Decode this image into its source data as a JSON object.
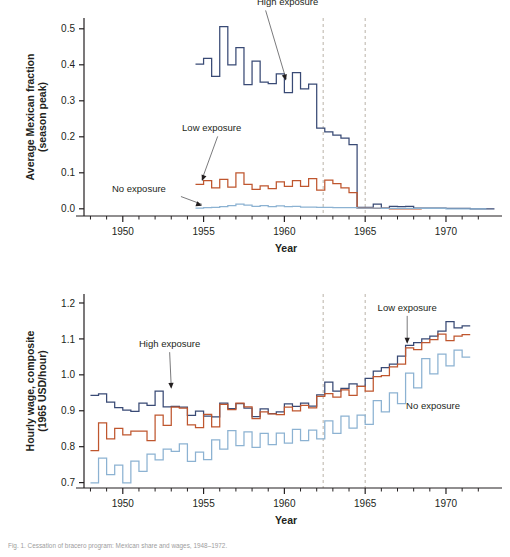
{
  "figure": {
    "caption": "Fig. 1. Cessation of bracero program: Mexican share and wages, 1948–1972."
  },
  "chart_data": [
    {
      "id": "top",
      "type": "line",
      "title": "",
      "xlabel": "Year",
      "ylabel": "Average Mexican fraction\n(season peak)",
      "ylabel_line1": "Average Mexican fraction",
      "ylabel_line2": "(season peak)",
      "xlim": [
        1947.6,
        1972.6
      ],
      "ylim": [
        -0.02,
        0.53
      ],
      "xticks": [
        1950,
        1955,
        1960,
        1965,
        1970
      ],
      "xticklabels": [
        "1950",
        "1955",
        "1960",
        "1965",
        "1970"
      ],
      "xminorticks": [
        1948,
        1949,
        1951,
        1952,
        1953,
        1954,
        1956,
        1957,
        1958,
        1959,
        1961,
        1962,
        1963,
        1964,
        1966,
        1967,
        1968,
        1969,
        1971,
        1972
      ],
      "yticks": [
        0.0,
        0.1,
        0.2,
        0.3,
        0.4,
        0.5
      ],
      "yticklabels": [
        "0.0",
        "0.1",
        "0.2",
        "0.3",
        "0.4",
        "0.5"
      ],
      "grid": false,
      "legend": "annotations",
      "vlines": [
        1962.4,
        1965.0
      ],
      "vline_style": "dashed",
      "vline_color": "#b9b2a8",
      "annotations": [
        {
          "label": "High exposure",
          "text_x": 1960.2,
          "text_y": 0.565,
          "point_x": 1960.1,
          "point_y": 0.352
        },
        {
          "label": "Low exposure",
          "text_x": 1955.5,
          "text_y": 0.215,
          "point_x": 1954.9,
          "point_y": 0.073
        },
        {
          "label": "No exposure",
          "text_x": 1951.0,
          "text_y": 0.048,
          "point_x": 1954.9,
          "point_y": 0.004
        }
      ],
      "series": [
        {
          "name": "High exposure",
          "color": "#394a75",
          "x": [
            1954.5,
            1955,
            1955.5,
            1956,
            1956.5,
            1957,
            1957.5,
            1958,
            1958.5,
            1959,
            1959.5,
            1960,
            1960.5,
            1961,
            1961.5,
            1962,
            1962.5,
            1963,
            1963.5,
            1964,
            1964.5,
            1965,
            1965.5,
            1966,
            1966.5,
            1967,
            1967.5,
            1968,
            1968.5,
            1969,
            1969.5,
            1970,
            1970.5,
            1971,
            1971.5,
            1972,
            1972.5
          ],
          "values": [
            0.402,
            0.418,
            0.368,
            0.506,
            0.4,
            0.448,
            0.345,
            0.41,
            0.352,
            0.348,
            0.375,
            0.323,
            0.378,
            0.333,
            0.346,
            0.224,
            0.214,
            0.205,
            0.196,
            0.178,
            0.004,
            0.004,
            0.013,
            0.002,
            0.007,
            0.006,
            0.007,
            0.002,
            0.002,
            0.002,
            0.002,
            0.001,
            0.001,
            0.001,
            0.0,
            0.0,
            0.0
          ]
        },
        {
          "name": "Low exposure",
          "color": "#bf562e",
          "x": [
            1954.5,
            1955,
            1955.5,
            1956,
            1956.5,
            1957,
            1957.5,
            1958,
            1958.5,
            1959,
            1959.5,
            1960,
            1960.5,
            1961,
            1961.5,
            1962,
            1962.5,
            1963,
            1963.5,
            1964,
            1964.5,
            1965,
            1965.5,
            1966,
            1966.5,
            1967,
            1967.5,
            1968
          ],
          "values": [
            0.068,
            0.078,
            0.058,
            0.082,
            0.06,
            0.1,
            0.068,
            0.054,
            0.064,
            0.056,
            0.075,
            0.062,
            0.078,
            0.062,
            0.084,
            0.052,
            0.08,
            0.07,
            0.058,
            0.045,
            0.002,
            0.002,
            0.001,
            0.001,
            0.0,
            0.0,
            0.0,
            0.0
          ]
        },
        {
          "name": "No exposure",
          "color": "#8cb2d2",
          "x": [
            1954.5,
            1955,
            1955.5,
            1956,
            1956.5,
            1957,
            1957.5,
            1958,
            1958.5,
            1959,
            1959.5,
            1960,
            1960.5,
            1961,
            1961.5,
            1962,
            1962.5,
            1963,
            1963.5,
            1964,
            1964.5,
            1965,
            1966,
            1967,
            1968,
            1969,
            1970,
            1971,
            1972
          ],
          "values": [
            0.002,
            0.003,
            0.004,
            0.006,
            0.009,
            0.013,
            0.01,
            0.007,
            0.009,
            0.006,
            0.008,
            0.006,
            0.007,
            0.005,
            0.005,
            0.004,
            0.004,
            0.003,
            0.003,
            0.003,
            0.002,
            0.002,
            0.001,
            0.001,
            0.001,
            0.001,
            0.0,
            0.0,
            0.0
          ]
        }
      ]
    },
    {
      "id": "bottom",
      "type": "line",
      "title": "",
      "xlabel": "Year",
      "ylabel": "Hourly wage, composite\n(1965 USD/hour)",
      "ylabel_line1": "Hourly wage, composite",
      "ylabel_line2": "(1965 USD/hour)",
      "xlim": [
        1947.6,
        1972.6
      ],
      "ylim": [
        0.685,
        1.225
      ],
      "xticks": [
        1950,
        1955,
        1960,
        1965,
        1970
      ],
      "xticklabels": [
        "1950",
        "1955",
        "1960",
        "1965",
        "1970"
      ],
      "xminorticks": [
        1948,
        1949,
        1951,
        1952,
        1953,
        1954,
        1956,
        1957,
        1958,
        1959,
        1961,
        1962,
        1963,
        1964,
        1966,
        1967,
        1968,
        1969,
        1971,
        1972
      ],
      "yticks": [
        0.7,
        0.8,
        0.9,
        1.0,
        1.1,
        1.2
      ],
      "yticklabels": [
        "0.7",
        "0.8",
        "0.9",
        "1.0",
        "1.1",
        "1.2"
      ],
      "grid": false,
      "legend": "annotations",
      "vlines": [
        1962.4,
        1965.0
      ],
      "vline_style": "dashed",
      "vline_color": "#b9b2a8",
      "annotations": [
        {
          "label": "High exposure",
          "text_x": 1952.9,
          "text_y": 1.077,
          "point_x": 1953.0,
          "point_y": 0.957
        },
        {
          "label": "Low exposure",
          "text_x": 1967.6,
          "text_y": 1.178,
          "point_x": 1967.6,
          "point_y": 1.082
        },
        {
          "label": "No exposure",
          "text_x": 1969.2,
          "text_y": 0.905,
          "point_x": null,
          "point_y": null
        }
      ],
      "series": [
        {
          "name": "High exposure",
          "color": "#394a75",
          "x": [
            1948,
            1948.5,
            1949,
            1949.5,
            1950,
            1950.5,
            1951,
            1951.5,
            1952,
            1952.5,
            1953,
            1953.5,
            1954,
            1954.5,
            1955,
            1955.5,
            1956,
            1956.5,
            1957,
            1957.5,
            1958,
            1958.5,
            1959,
            1959.5,
            1960,
            1960.5,
            1961,
            1961.5,
            1962,
            1962.5,
            1963,
            1963.5,
            1964,
            1964.5,
            1965,
            1965.5,
            1966,
            1966.5,
            1967,
            1967.5,
            1968,
            1968.5,
            1969,
            1969.5,
            1970,
            1970.5,
            1971
          ],
          "values": [
            0.943,
            0.947,
            0.924,
            0.909,
            0.902,
            0.898,
            0.921,
            0.915,
            0.955,
            0.911,
            0.912,
            0.91,
            0.887,
            0.899,
            0.885,
            0.883,
            0.921,
            0.906,
            0.92,
            0.907,
            0.884,
            0.905,
            0.892,
            0.897,
            0.919,
            0.912,
            0.921,
            0.913,
            0.944,
            0.98,
            0.955,
            0.962,
            0.975,
            0.968,
            0.99,
            1.01,
            1.02,
            1.03,
            1.052,
            1.082,
            1.09,
            1.1,
            1.108,
            1.122,
            1.148,
            1.131,
            1.136
          ]
        },
        {
          "name": "Low exposure",
          "color": "#bf562e",
          "x": [
            1948,
            1948.5,
            1949,
            1949.5,
            1950,
            1950.5,
            1951,
            1951.5,
            1952,
            1952.5,
            1953,
            1953.5,
            1954,
            1954.5,
            1955,
            1955.5,
            1956,
            1956.5,
            1957,
            1957.5,
            1958,
            1958.5,
            1959,
            1959.5,
            1960,
            1960.5,
            1961,
            1961.5,
            1962,
            1962.5,
            1963,
            1963.5,
            1964,
            1964.5,
            1965,
            1965.5,
            1966,
            1966.5,
            1967,
            1967.5,
            1968,
            1968.5,
            1969,
            1969.5,
            1970,
            1970.5,
            1971
          ],
          "values": [
            0.789,
            0.866,
            0.822,
            0.851,
            0.833,
            0.843,
            0.843,
            0.817,
            0.888,
            0.859,
            0.91,
            0.907,
            0.861,
            0.853,
            0.89,
            0.855,
            0.918,
            0.903,
            0.921,
            0.911,
            0.878,
            0.897,
            0.891,
            0.889,
            0.91,
            0.9,
            0.915,
            0.908,
            0.94,
            0.948,
            0.938,
            0.958,
            0.943,
            0.968,
            0.955,
            0.995,
            0.998,
            1.022,
            1.03,
            1.075,
            1.07,
            1.09,
            1.098,
            1.113,
            1.095,
            1.108,
            1.112
          ]
        },
        {
          "name": "No exposure",
          "color": "#8cb2d2",
          "x": [
            1948,
            1948.5,
            1949,
            1949.5,
            1950,
            1950.5,
            1951,
            1951.5,
            1952,
            1952.5,
            1953,
            1953.5,
            1954,
            1954.5,
            1955,
            1955.5,
            1956,
            1956.5,
            1957,
            1957.5,
            1958,
            1958.5,
            1959,
            1959.5,
            1960,
            1960.5,
            1961,
            1961.5,
            1962,
            1962.5,
            1963,
            1963.5,
            1964,
            1964.5,
            1965,
            1965.5,
            1966,
            1966.5,
            1967,
            1967.5,
            1968,
            1968.5,
            1969,
            1969.5,
            1970,
            1970.5,
            1971
          ],
          "values": [
            0.699,
            0.768,
            0.722,
            0.749,
            0.699,
            0.76,
            0.731,
            0.779,
            0.763,
            0.793,
            0.787,
            0.808,
            0.759,
            0.785,
            0.764,
            0.819,
            0.793,
            0.845,
            0.803,
            0.841,
            0.798,
            0.837,
            0.806,
            0.838,
            0.81,
            0.848,
            0.817,
            0.846,
            0.822,
            0.872,
            0.837,
            0.885,
            0.852,
            0.888,
            0.862,
            0.928,
            0.897,
            0.95,
            0.92,
            1.005,
            0.964,
            1.045,
            1.003,
            1.058,
            1.025,
            1.069,
            1.049
          ]
        }
      ]
    }
  ]
}
